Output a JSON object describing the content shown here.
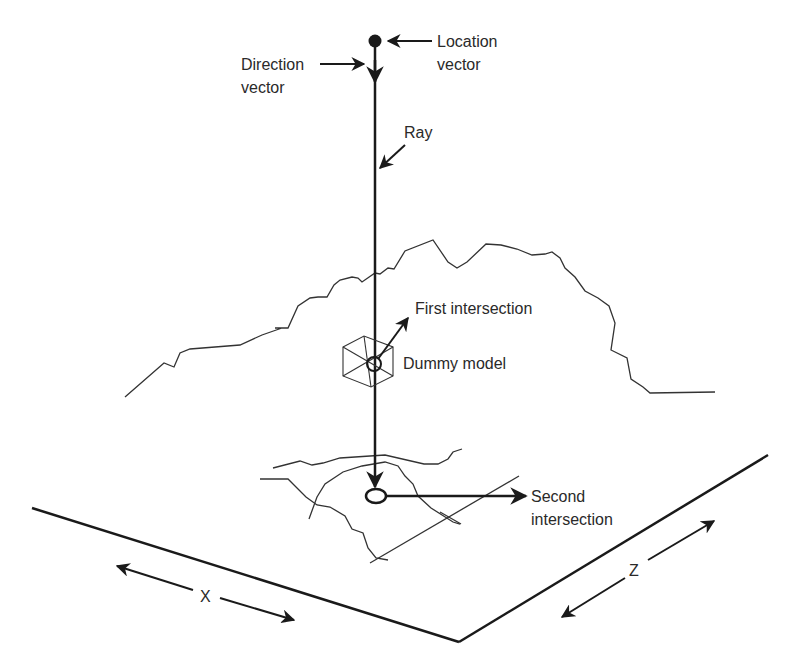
{
  "diagram": {
    "labels": {
      "location_vector_line1": "Location",
      "location_vector_line2": "vector",
      "direction_vector_line1": "Direction",
      "direction_vector_line2": "vector",
      "ray": "Ray",
      "first_intersection": "First intersection",
      "dummy_model": "Dummy model",
      "second_intersection_line1": "Second",
      "second_intersection_line2": "intersection",
      "x_axis": "X",
      "z_axis": "Z"
    },
    "colors": {
      "line": "#1a1a1a",
      "terrain": "#333333",
      "text": "#2a2a2a",
      "background": "#ffffff"
    }
  }
}
